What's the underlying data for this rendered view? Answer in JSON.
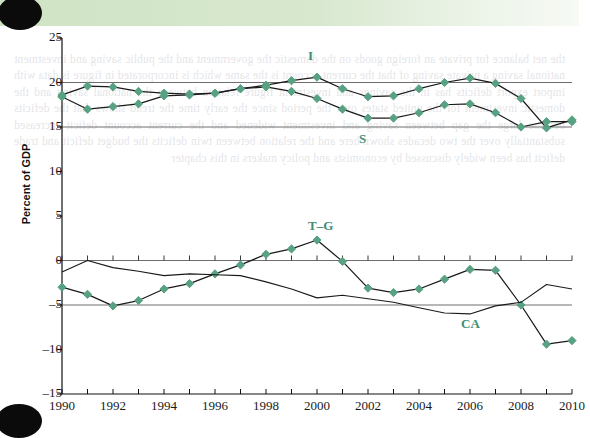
{
  "header": {
    "figure_number": "FIGURE 9.2",
    "title": "U.S. Savings and Investment, 1990–2010",
    "band_color": "#cfe3c4"
  },
  "axes": {
    "ylabel": "Percent of GDP",
    "yticks": [
      25,
      20,
      15,
      10,
      5,
      0,
      -5,
      -10,
      -15
    ],
    "ytick_labels": [
      "25",
      "20",
      "15",
      "10",
      "5",
      "0",
      "–5",
      "–10",
      "–15"
    ],
    "xtick_labels": [
      "1990",
      "1992",
      "1994",
      "1996",
      "1998",
      "2000",
      "2002",
      "2004",
      "2006",
      "2008",
      "2010"
    ],
    "xlim": [
      1990,
      2010
    ],
    "ylim": [
      -15,
      25
    ]
  },
  "style": {
    "marker_color": "#58a183",
    "line_color": "#1a1a1a",
    "gridline_color": "#6e6e6e",
    "label_color": "#3f8f74"
  },
  "chart_data": {
    "type": "line",
    "title": "U.S. Savings and Investment, 1990–2010",
    "xlabel": "",
    "ylabel": "Percent of GDP",
    "xlim": [
      1990,
      2010
    ],
    "ylim": [
      -15,
      25
    ],
    "grid": "horizontal gridlines at 20, 15, 0, -5",
    "legend": "inline series labels (I, S, T–G, CA)",
    "x": [
      1990,
      1991,
      1992,
      1993,
      1994,
      1995,
      1996,
      1997,
      1998,
      1999,
      2000,
      2001,
      2002,
      2003,
      2004,
      2005,
      2006,
      2007,
      2008,
      2009,
      2010
    ],
    "series": [
      {
        "name": "I",
        "label": "I",
        "label_x": 2000,
        "label_y": 23.0,
        "markers": true,
        "values": [
          18.6,
          19.6,
          19.5,
          19.0,
          18.8,
          18.7,
          18.8,
          19.3,
          19.7,
          20.2,
          20.6,
          19.3,
          18.4,
          18.5,
          19.3,
          20.0,
          20.5,
          19.9,
          18.2,
          14.9,
          15.8
        ]
      },
      {
        "name": "S",
        "label": "S",
        "label_x": 2002,
        "label_y": 13.6,
        "markers": true,
        "values": [
          18.4,
          17.0,
          17.3,
          17.6,
          18.5,
          18.6,
          18.8,
          19.3,
          19.5,
          19.0,
          18.2,
          17.0,
          16.0,
          16.0,
          16.6,
          17.5,
          17.6,
          16.6,
          15.0,
          15.6,
          15.6
        ]
      },
      {
        "name": "T–G",
        "label": "T–G",
        "label_x": 2000,
        "label_y": 3.9,
        "markers": true,
        "values": [
          -3.0,
          -3.8,
          -5.1,
          -4.5,
          -3.2,
          -2.6,
          -1.5,
          -0.5,
          0.7,
          1.3,
          2.3,
          -0.1,
          -3.1,
          -3.6,
          -3.2,
          -2.1,
          -1.0,
          -1.1,
          -5.0,
          -9.4,
          -9.0
        ]
      },
      {
        "name": "CA",
        "label": "CA",
        "label_x": 2006,
        "label_y": -7.1,
        "markers": false,
        "values": [
          -1.3,
          0.0,
          -0.8,
          -1.2,
          -1.7,
          -1.5,
          -1.6,
          -1.7,
          -2.4,
          -3.2,
          -4.2,
          -3.9,
          -4.3,
          -4.7,
          -5.3,
          -5.9,
          -6.0,
          -5.1,
          -4.7,
          -2.7,
          -3.2
        ]
      }
    ]
  }
}
